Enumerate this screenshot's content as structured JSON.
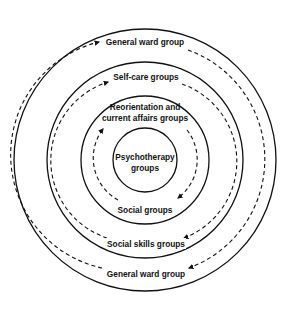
{
  "diagram": {
    "type": "concentric-rings",
    "center": {
      "x": 145,
      "y": 160
    },
    "rings": [
      {
        "id": "outer",
        "radius": 131
      },
      {
        "id": "second",
        "radius": 98
      },
      {
        "id": "third",
        "radius": 64
      },
      {
        "id": "inner",
        "radius": 32
      }
    ],
    "core": {
      "line1": "Psychotherapy",
      "line2": "groups"
    },
    "top_labels": {
      "outer": "General ward group",
      "second": "Self-care groups",
      "third_line1": "Reorientation and",
      "third_line2": "current affairs groups"
    },
    "bottom_labels": {
      "third": "Social groups",
      "second": "Social skills groups",
      "outer": "General ward group"
    },
    "flow_direction": "clockwise dashed arrows between rings",
    "colors": {
      "line": "#111111",
      "background": "#ffffff"
    }
  }
}
